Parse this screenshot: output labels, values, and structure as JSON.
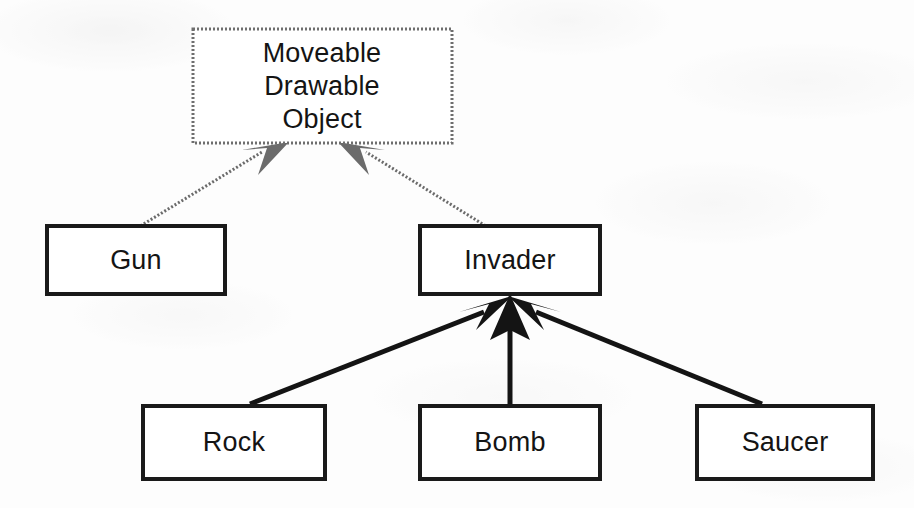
{
  "diagram": {
    "type": "class-inheritance-hierarchy",
    "canvas": {
      "width": 914,
      "height": 508
    },
    "background_color": "#fdfdfd",
    "line_color": "#141414",
    "faded_line_color": "#6b6b6b",
    "text_color": "#141414",
    "nodes": [
      {
        "id": "root",
        "lines": [
          "Moveable",
          "Drawable",
          "Object"
        ],
        "label": "Moveable Drawable Object",
        "x": 193,
        "y": 29,
        "width": 259,
        "height": 114,
        "border_style": "dithered",
        "level": 0
      },
      {
        "id": "gun",
        "lines": [
          "Gun"
        ],
        "label": "Gun",
        "x": 47,
        "y": 226,
        "width": 178,
        "height": 68,
        "border_style": "solid",
        "level": 1
      },
      {
        "id": "invader",
        "lines": [
          "Invader"
        ],
        "label": "Invader",
        "x": 420,
        "y": 226,
        "width": 180,
        "height": 68,
        "border_style": "solid",
        "level": 1
      },
      {
        "id": "rock",
        "lines": [
          "Rock"
        ],
        "label": "Rock",
        "x": 143,
        "y": 406,
        "width": 182,
        "height": 73,
        "border_style": "solid",
        "level": 2
      },
      {
        "id": "bomb",
        "lines": [
          "Bomb"
        ],
        "label": "Bomb",
        "x": 420,
        "y": 406,
        "width": 180,
        "height": 73,
        "border_style": "solid",
        "level": 2
      },
      {
        "id": "saucer",
        "lines": [
          "Saucer"
        ],
        "label": "Saucer",
        "x": 697,
        "y": 406,
        "width": 176,
        "height": 73,
        "border_style": "solid",
        "level": 2
      }
    ],
    "edges": [
      {
        "id": "gun-to-root",
        "from": "gun",
        "to": "root",
        "relation": "inherits",
        "style": "dithered"
      },
      {
        "id": "invader-to-root",
        "from": "invader",
        "to": "root",
        "relation": "inherits",
        "style": "dithered"
      },
      {
        "id": "rock-to-invader",
        "from": "rock",
        "to": "invader",
        "relation": "inherits",
        "style": "solid"
      },
      {
        "id": "bomb-to-invader",
        "from": "bomb",
        "to": "invader",
        "relation": "inherits",
        "style": "solid"
      },
      {
        "id": "saucer-to-invader",
        "from": "saucer",
        "to": "invader",
        "relation": "inherits",
        "style": "solid"
      }
    ]
  }
}
